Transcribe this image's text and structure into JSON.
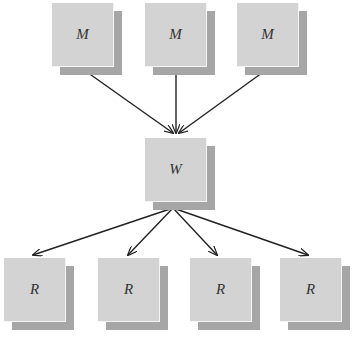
{
  "diagram": {
    "type": "tree",
    "nodes": [
      {
        "id": "m1",
        "label": "M",
        "x": 52,
        "y": 3
      },
      {
        "id": "m2",
        "label": "M",
        "x": 145,
        "y": 3
      },
      {
        "id": "m3",
        "label": "M",
        "x": 237,
        "y": 3
      },
      {
        "id": "w",
        "label": "W",
        "x": 145,
        "y": 138
      },
      {
        "id": "r1",
        "label": "R",
        "x": 4,
        "y": 258
      },
      {
        "id": "r2",
        "label": "R",
        "x": 98,
        "y": 258
      },
      {
        "id": "r3",
        "label": "R",
        "x": 190,
        "y": 258
      },
      {
        "id": "r4",
        "label": "R",
        "x": 280,
        "y": 258
      }
    ],
    "edges": [
      {
        "from": "m1",
        "to": "w"
      },
      {
        "from": "m2",
        "to": "w"
      },
      {
        "from": "m3",
        "to": "w"
      },
      {
        "from": "w",
        "to": "r1"
      },
      {
        "from": "w",
        "to": "r2"
      },
      {
        "from": "w",
        "to": "r3"
      },
      {
        "from": "w",
        "to": "r4"
      }
    ],
    "colors": {
      "face": "#d3d3d3",
      "shadow": "#a6a6a6",
      "edge": "#222222",
      "text": "#333333"
    }
  }
}
